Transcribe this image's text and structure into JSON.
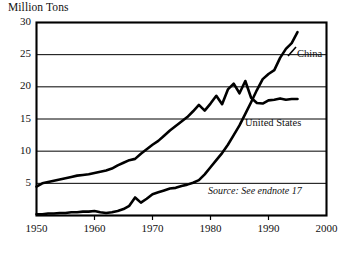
{
  "chart_data": {
    "type": "line",
    "title": "",
    "ylabel": "Million Tons",
    "xlabel": "",
    "xlim": [
      1950,
      2000
    ],
    "ylim": [
      0,
      30
    ],
    "grid": true,
    "legend_position": "inline-annotation",
    "y_ticks": [
      30,
      25,
      20,
      15,
      10,
      5
    ],
    "x_ticks": [
      1950,
      1960,
      1970,
      1980,
      1990,
      2000
    ],
    "annotations": [
      "Source: See endnote 17"
    ],
    "series": [
      {
        "name": "United States",
        "x": [
          1950,
          1951,
          1952,
          1953,
          1954,
          1955,
          1956,
          1957,
          1958,
          1959,
          1960,
          1961,
          1962,
          1963,
          1964,
          1965,
          1966,
          1967,
          1968,
          1969,
          1970,
          1971,
          1972,
          1973,
          1974,
          1975,
          1976,
          1977,
          1978,
          1979,
          1980,
          1981,
          1982,
          1983,
          1984,
          1985,
          1986,
          1987,
          1988,
          1989,
          1990,
          1991,
          1992,
          1993,
          1994,
          1995
        ],
        "values": [
          4.5,
          5.0,
          5.2,
          5.4,
          5.6,
          5.8,
          6.0,
          6.2,
          6.3,
          6.4,
          6.6,
          6.8,
          7.0,
          7.3,
          7.8,
          8.2,
          8.6,
          8.8,
          9.6,
          10.3,
          11.0,
          11.6,
          12.4,
          13.2,
          13.9,
          14.6,
          15.3,
          16.2,
          17.2,
          16.3,
          17.4,
          18.6,
          17.3,
          19.6,
          20.5,
          19.0,
          20.9,
          18.3,
          17.5,
          17.4,
          17.9,
          18.0,
          18.2,
          18.0,
          18.1,
          18.1
        ]
      },
      {
        "name": "China",
        "x": [
          1950,
          1951,
          1952,
          1953,
          1954,
          1955,
          1956,
          1957,
          1958,
          1959,
          1960,
          1961,
          1962,
          1963,
          1964,
          1965,
          1966,
          1967,
          1968,
          1969,
          1970,
          1971,
          1972,
          1973,
          1974,
          1975,
          1976,
          1977,
          1978,
          1979,
          1980,
          1981,
          1982,
          1983,
          1984,
          1985,
          1986,
          1987,
          1988,
          1989,
          1990,
          1991,
          1992,
          1993,
          1994,
          1995
        ],
        "values": [
          0.2,
          0.2,
          0.3,
          0.3,
          0.4,
          0.4,
          0.5,
          0.5,
          0.6,
          0.6,
          0.7,
          0.5,
          0.4,
          0.5,
          0.7,
          1.0,
          1.5,
          2.8,
          2.0,
          2.6,
          3.3,
          3.6,
          3.9,
          4.2,
          4.3,
          4.6,
          4.8,
          5.1,
          5.5,
          6.4,
          7.5,
          8.6,
          9.7,
          11.0,
          12.5,
          14.0,
          15.8,
          17.6,
          19.5,
          21.2,
          22.0,
          22.6,
          24.5,
          25.9,
          26.8,
          28.5
        ]
      }
    ]
  },
  "labels": {
    "china": "China",
    "united_states": "United States",
    "source": "Source: See endnote 17",
    "y_axis_title": "Million Tons"
  },
  "y_tick_labels": [
    "30",
    "25",
    "20",
    "15",
    "10",
    "5"
  ],
  "x_tick_labels": [
    "1950",
    "1960",
    "1970",
    "1980",
    "1990",
    "2000"
  ],
  "colors": {
    "line": "#000000",
    "frame": "#000000",
    "grid": "#000000",
    "background": "#ffffff",
    "text": "#111111"
  }
}
